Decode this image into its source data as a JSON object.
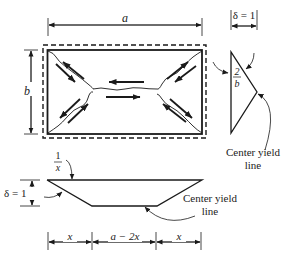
{
  "plan_view": {
    "width_label": "a",
    "height_label": "b"
  },
  "side_section": {
    "deflection_label": "δ = 1",
    "rotation_num": "2",
    "rotation_den": "b",
    "yield_line_label_1": "Center yield",
    "yield_line_label_2": "line"
  },
  "long_section": {
    "rotation_num": "1",
    "rotation_den": "x",
    "deflection_label": "δ = 1",
    "yield_line_label_1": "Center yield",
    "yield_line_label_2": "line",
    "segments": [
      "x",
      "a − 2x",
      "x"
    ]
  },
  "colors": {
    "line": "#1a1a1a"
  }
}
